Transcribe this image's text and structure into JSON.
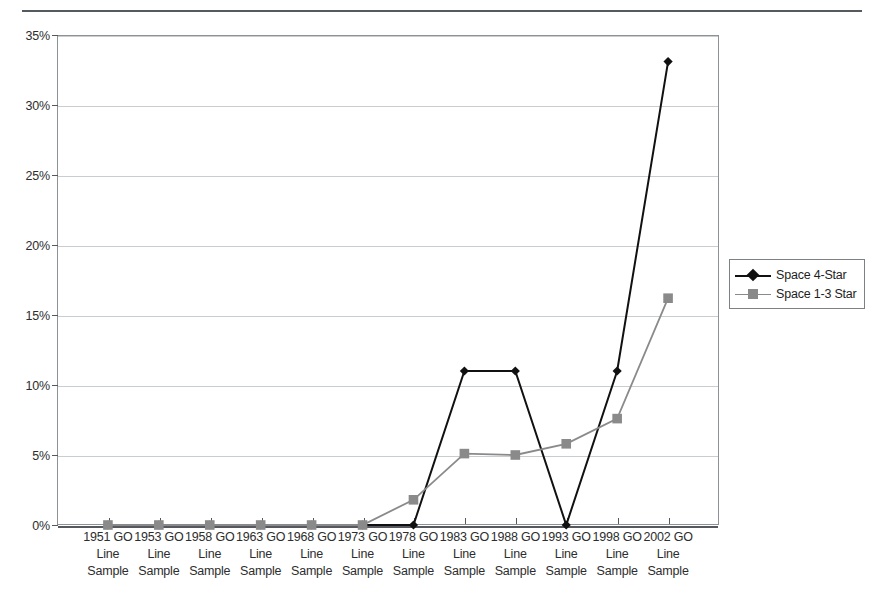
{
  "chart_data": {
    "type": "line",
    "title": "",
    "xlabel": "",
    "ylabel": "",
    "ylim": [
      0,
      35
    ],
    "ytick_labels": [
      "0%",
      "5%",
      "10%",
      "15%",
      "20%",
      "25%",
      "30%",
      "35%"
    ],
    "ytick_values": [
      0,
      5,
      10,
      15,
      20,
      25,
      30,
      35
    ],
    "grid": true,
    "legend_position": "right",
    "categories": [
      "1951 GO Line Sample",
      "1953 GO Line Sample",
      "1958 GO Line Sample",
      "1963 GO Line Sample",
      "1968 GO Line Sample",
      "1973 GO Line Sample",
      "1978 GO Line Sample",
      "1983 GO Line Sample",
      "1988 GO Line Sample",
      "1993 GO Line Sample",
      "1998 GO Line Sample",
      "2002 GO Line Sample"
    ],
    "category_lines": [
      [
        "1951 GO",
        "Line",
        "Sample"
      ],
      [
        "1953 GO",
        "Line",
        "Sample"
      ],
      [
        "1958 GO",
        "Line",
        "Sample"
      ],
      [
        "1963 GO",
        "Line",
        "Sample"
      ],
      [
        "1968 GO",
        "Line",
        "Sample"
      ],
      [
        "1973 GO",
        "Line",
        "Sample"
      ],
      [
        "1978 GO",
        "Line",
        "Sample"
      ],
      [
        "1983 GO",
        "Line",
        "Sample"
      ],
      [
        "1988 GO",
        "Line",
        "Sample"
      ],
      [
        "1993 GO",
        "Line",
        "Sample"
      ],
      [
        "1998 GO",
        "Line",
        "Sample"
      ],
      [
        "2002 GO",
        "Line",
        "Sample"
      ]
    ],
    "series": [
      {
        "name": "Space 4-Star",
        "color": "#111111",
        "marker": "diamond",
        "values": [
          0,
          0,
          0,
          0,
          0,
          0,
          0,
          11.0,
          11.0,
          0,
          11.0,
          33.1
        ]
      },
      {
        "name": "Space 1-3 Star",
        "color": "#8a8a8a",
        "marker": "square",
        "values": [
          0,
          0,
          0,
          0,
          0,
          0,
          1.8,
          5.1,
          5.0,
          5.8,
          7.6,
          16.2
        ]
      }
    ]
  },
  "legend": {
    "entries": [
      {
        "label": "Space 4-Star"
      },
      {
        "label": "Space 1-3 Star"
      }
    ]
  }
}
